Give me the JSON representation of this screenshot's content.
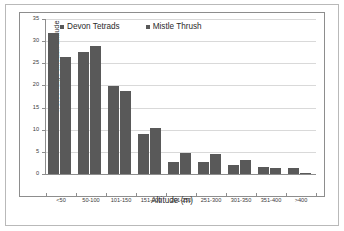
{
  "chart_data": {
    "type": "bar",
    "title": "",
    "xlabel": "Altitude (m)",
    "ylabel": "Percentage at each altitude",
    "categories": [
      "<50",
      "50-100",
      "101-150",
      "151-200",
      "201-250",
      "251-300",
      "301-350",
      "351-400",
      ">400"
    ],
    "series": [
      {
        "name": "Devon Tetrads",
        "color": "#595959",
        "values": [
          31.9,
          27.6,
          19.9,
          9.0,
          2.7,
          2.7,
          2.1,
          1.6,
          1.3
        ]
      },
      {
        "name": "Mistle Thrush",
        "color": "#595959",
        "values": [
          26.4,
          28.8,
          18.7,
          10.4,
          4.8,
          4.6,
          3.2,
          1.4,
          0.2
        ]
      }
    ],
    "ylim": [
      0,
      35
    ],
    "yticks": [
      0,
      5,
      10,
      15,
      20,
      25,
      30,
      35
    ],
    "ytick_labels": [
      "0",
      "5",
      "10",
      "15",
      "20",
      "25",
      "30",
      "35"
    ],
    "grid": true,
    "legend_position": "top-center"
  },
  "legend": {
    "entries": [
      {
        "label": "Devon Tetrads",
        "marker": "square-marker"
      },
      {
        "label": "Mistle Thrush",
        "marker": "square-marker"
      }
    ]
  },
  "axes": {
    "x_title": "Altitude (m)",
    "y_title": "Percentage at each altitude"
  }
}
